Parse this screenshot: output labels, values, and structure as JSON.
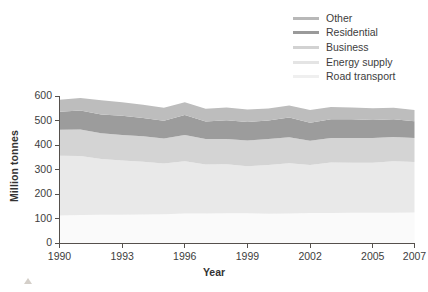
{
  "axes": {
    "ylabel": "Million tonnes",
    "xlabel": "Year",
    "yticks": [
      "0",
      "100",
      "200",
      "300",
      "400",
      "500",
      "600"
    ],
    "xticks": [
      "1990",
      "1993",
      "1996",
      "1999",
      "2002",
      "2005",
      "2007"
    ]
  },
  "legend": {
    "items": [
      {
        "label": "Other",
        "color": "#b8b8b8"
      },
      {
        "label": "Residential",
        "color": "#9a9a9a"
      },
      {
        "label": "Business",
        "color": "#d2d2d2"
      },
      {
        "label": "Energy supply",
        "color": "#e8e8e8"
      },
      {
        "label": "Road transport",
        "color": "#f7f7f7"
      }
    ]
  },
  "colors": {
    "other": "#bdbdbd",
    "residential": "#9c9c9c",
    "business": "#d4d4d4",
    "energy_supply": "#e9e9e9",
    "road_transport": "#fafafa",
    "axis": "#55504c",
    "text": "#3d3d3d",
    "marker": "#d4cfc9"
  },
  "chart_data": {
    "type": "area",
    "title": "",
    "xlabel": "Year",
    "ylabel": "Million tonnes",
    "xlim": [
      1990,
      2007
    ],
    "ylim": [
      0,
      600
    ],
    "grid": false,
    "legend_position": "top-right",
    "stacked": true,
    "stack_order_bottom_to_top": [
      "Road transport",
      "Energy supply",
      "Business",
      "Residential",
      "Other"
    ],
    "x": [
      1990,
      1991,
      1992,
      1993,
      1994,
      1995,
      1996,
      1997,
      1998,
      1999,
      2000,
      2001,
      2002,
      2003,
      2004,
      2005,
      2006,
      2007
    ],
    "series": [
      {
        "name": "Road transport",
        "color": "#fafafa",
        "values": [
          112,
          114,
          115,
          115,
          116,
          117,
          120,
          120,
          121,
          121,
          119,
          120,
          122,
          122,
          123,
          123,
          123,
          124
        ]
      },
      {
        "name": "Energy supply",
        "color": "#e9e9e9",
        "values": [
          244,
          241,
          228,
          222,
          216,
          208,
          214,
          200,
          200,
          192,
          199,
          206,
          196,
          207,
          205,
          205,
          211,
          207
        ]
      },
      {
        "name": "Business",
        "color": "#d4d4d4",
        "values": [
          106,
          108,
          105,
          104,
          104,
          102,
          107,
          104,
          104,
          105,
          106,
          106,
          99,
          100,
          101,
          101,
          99,
          98
        ]
      },
      {
        "name": "Residential",
        "color": "#9c9c9c",
        "values": [
          74,
          78,
          76,
          78,
          74,
          72,
          81,
          72,
          76,
          76,
          76,
          80,
          74,
          76,
          76,
          73,
          72,
          68
        ]
      },
      {
        "name": "Other",
        "color": "#bdbdbd",
        "values": [
          49,
          51,
          59,
          56,
          54,
          53,
          53,
          52,
          52,
          51,
          49,
          49,
          52,
          50,
          48,
          48,
          47,
          46
        ]
      }
    ],
    "totals": [
      585,
      592,
      583,
      575,
      564,
      552,
      575,
      548,
      553,
      545,
      549,
      561,
      543,
      555,
      553,
      550,
      552,
      543
    ]
  }
}
